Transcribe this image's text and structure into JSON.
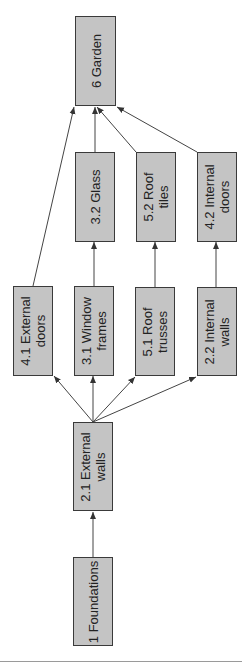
{
  "diagram": {
    "type": "precedence network (rotated 90°)",
    "colors": {
      "node_fill": "#c4c4c4",
      "node_border": "#3a3a3a",
      "edge": "#444444",
      "rule": "#9a9a9a"
    },
    "nodes": [
      {
        "id": "6",
        "label": "6 Garden",
        "x": 75,
        "y": 16,
        "w": 41,
        "h": 90
      },
      {
        "id": "3.2",
        "label": "3.2 Glass",
        "x": 75,
        "y": 152,
        "w": 40,
        "h": 90
      },
      {
        "id": "5.2",
        "label": "5.2 Roof\ntiles",
        "x": 136,
        "y": 152,
        "w": 40,
        "h": 90
      },
      {
        "id": "4.2",
        "label": "4.2 Internal\ndoors",
        "x": 197,
        "y": 152,
        "w": 40,
        "h": 90
      },
      {
        "id": "4.1",
        "label": "4.1 External\ndoors",
        "x": 13,
        "y": 286,
        "w": 40,
        "h": 90
      },
      {
        "id": "3.1",
        "label": "3.1 Window\nframes",
        "x": 74,
        "y": 286,
        "w": 40,
        "h": 90
      },
      {
        "id": "5.1",
        "label": "5.1 Roof\ntrusses",
        "x": 135,
        "y": 287,
        "w": 40,
        "h": 89
      },
      {
        "id": "2.2",
        "label": "2.2 Internal\nwalls",
        "x": 197,
        "y": 287,
        "w": 40,
        "h": 89
      },
      {
        "id": "2.1",
        "label": "2.1 External\nwalls",
        "x": 73,
        "y": 422,
        "w": 40,
        "h": 89
      },
      {
        "id": "1",
        "label": "1 Foundations",
        "x": 73,
        "y": 557,
        "w": 40,
        "h": 89
      }
    ],
    "edges": [
      {
        "from": "1",
        "to": "2.1",
        "x1": 93,
        "y1": 557,
        "x2": 93,
        "y2": 512
      },
      {
        "from": "2.1",
        "to": "4.1",
        "x1": 93,
        "y1": 422,
        "x2": 54,
        "y2": 376
      },
      {
        "from": "2.1",
        "to": "3.1",
        "x1": 93,
        "y1": 422,
        "x2": 93,
        "y2": 376
      },
      {
        "from": "2.1",
        "to": "5.1",
        "x1": 93,
        "y1": 422,
        "x2": 135,
        "y2": 377
      },
      {
        "from": "2.1",
        "to": "2.2",
        "x1": 93,
        "y1": 422,
        "x2": 196,
        "y2": 377
      },
      {
        "from": "3.1",
        "to": "3.2",
        "x1": 94,
        "y1": 286,
        "x2": 94,
        "y2": 242
      },
      {
        "from": "5.1",
        "to": "5.2",
        "x1": 155,
        "y1": 287,
        "x2": 155,
        "y2": 242
      },
      {
        "from": "2.2",
        "to": "4.2",
        "x1": 216,
        "y1": 287,
        "x2": 216,
        "y2": 242
      },
      {
        "from": "4.1",
        "to": "6",
        "x1": 33,
        "y1": 286,
        "x2": 74,
        "y2": 107
      },
      {
        "from": "3.2",
        "to": "6",
        "x1": 95,
        "y1": 152,
        "x2": 95,
        "y2": 107
      },
      {
        "from": "5.2",
        "to": "6",
        "x1": 136,
        "y1": 152,
        "x2": 97,
        "y2": 107
      },
      {
        "from": "4.2",
        "to": "6",
        "x1": 197,
        "y1": 152,
        "x2": 117,
        "y2": 107
      }
    ]
  }
}
